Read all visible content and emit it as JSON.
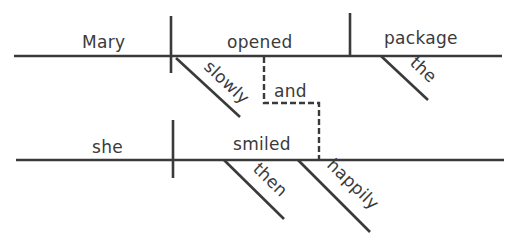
{
  "diagram": {
    "type": "sentence-diagram",
    "clause1": {
      "subject": "Mary",
      "verb": "opened",
      "object": "package",
      "verb_modifier": "slowly",
      "object_modifier": "the"
    },
    "conjunction": "and",
    "clause2": {
      "subject": "she",
      "verb": "smiled",
      "verb_modifiers": [
        "then",
        "happily"
      ]
    },
    "colors": {
      "ink": "#3a3a3a",
      "background": "#ffffff"
    }
  }
}
